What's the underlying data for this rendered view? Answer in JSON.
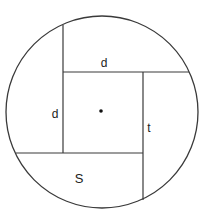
{
  "diagram": {
    "stroke_color": "#3a3a3a",
    "background": "#ffffff",
    "circle": {
      "cx": 102,
      "cy": 112,
      "r": 96
    },
    "center_point": {
      "cx": 101,
      "cy": 111,
      "r": 1.8
    },
    "lines": [
      {
        "name": "top-edge",
        "x1": 63,
        "y1": 72,
        "x2": 189,
        "y2": 72
      },
      {
        "name": "left-edge",
        "x1": 63,
        "y1": 25,
        "x2": 63,
        "y2": 153
      },
      {
        "name": "bottom-edge",
        "x1": 16,
        "y1": 153,
        "x2": 143,
        "y2": 153
      },
      {
        "name": "right-edge",
        "x1": 143,
        "y1": 72,
        "x2": 143,
        "y2": 200
      }
    ],
    "labels": [
      {
        "name": "label-top-d",
        "text": "d",
        "x": 104,
        "y": 67
      },
      {
        "name": "label-left-d",
        "text": "d",
        "x": 55,
        "y": 118
      },
      {
        "name": "label-right-t",
        "text": "t",
        "x": 149,
        "y": 132
      },
      {
        "name": "label-bottom-s",
        "text": "S",
        "x": 79,
        "y": 183
      }
    ]
  }
}
